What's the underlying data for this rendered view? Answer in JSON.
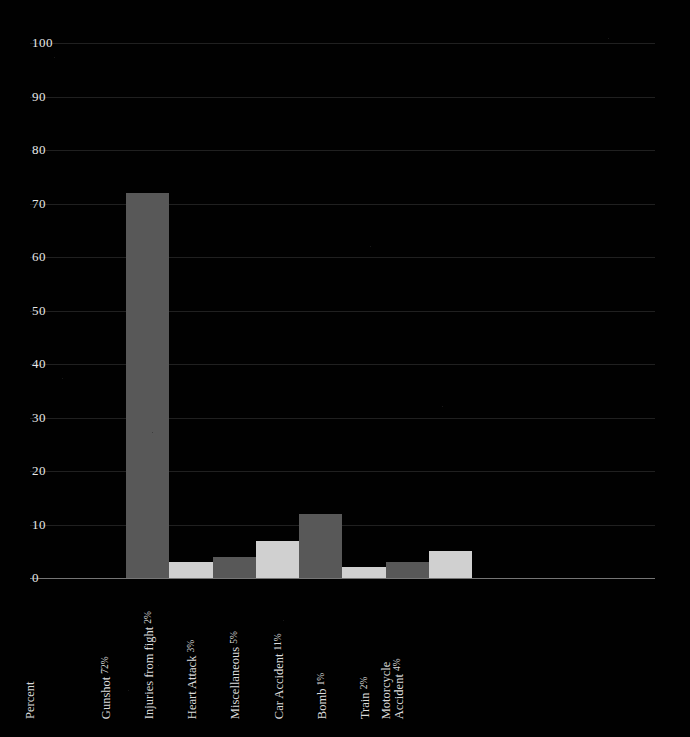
{
  "chart_data": {
    "type": "bar",
    "title": "",
    "xlabel": "Percent",
    "ylabel": "",
    "ylim": [
      0,
      100
    ],
    "ytick_step": 10,
    "yticks": [
      "0",
      "10",
      "20",
      "30",
      "40",
      "50",
      "60",
      "70",
      "80",
      "90",
      "100"
    ],
    "grid": true,
    "legend": "none",
    "categories": [
      "Gunshot",
      "Injuries from fight",
      "Heart Attack",
      "Miscellaneous",
      "Car Accident",
      "Bomb",
      "Train",
      "Motorcycle Accident"
    ],
    "values": [
      72,
      3,
      4,
      7,
      12,
      2,
      3,
      5
    ],
    "labels": [
      "Gunshot 72%",
      "Injuries from fight 2%",
      "Heart Attack 3%",
      "Miscellaneous 5%",
      "Car Accident 11%",
      "Bomb 1%",
      "Train 2%",
      "Motorcycle Accident 4%"
    ],
    "percent_text": [
      "72%",
      "2%",
      "3%",
      "5%",
      "11%",
      "1%",
      "2%",
      "4%"
    ],
    "bar_colors": [
      "#585858",
      "#d0d0d0",
      "#585858",
      "#d0d0d0",
      "#585858",
      "#d0d0d0",
      "#585858",
      "#d0d0d0"
    ]
  },
  "axis": {
    "x_title": "Percent",
    "tick_labels": [
      "0",
      "10",
      "20",
      "30",
      "40",
      "50",
      "60",
      "70",
      "80",
      "90",
      "100"
    ],
    "category_labels": [
      {
        "name": "Gunshot",
        "pct": "72%",
        "two_line": false
      },
      {
        "name": "Injuries from fight",
        "pct": "2%",
        "two_line": false
      },
      {
        "name": "Heart Attack",
        "pct": "3%",
        "two_line": false
      },
      {
        "name": "Miscellaneous",
        "pct": "5%",
        "two_line": false
      },
      {
        "name": "Car Accident",
        "pct": "11%",
        "two_line": false
      },
      {
        "name": "Bomb",
        "pct": "1%",
        "two_line": false
      },
      {
        "name": "Train",
        "pct": "2%",
        "two_line": false
      },
      {
        "name": "Motorcycle Accident",
        "pct": "4%",
        "two_line": true
      }
    ]
  },
  "style": {
    "background": "#010101",
    "gridline_color": "#3a3a3a",
    "baseline_color": "#8a8a8a",
    "tick_text_color": "#e8e8e8",
    "bar_dark": "#585858",
    "bar_light": "#d0d0d0"
  }
}
